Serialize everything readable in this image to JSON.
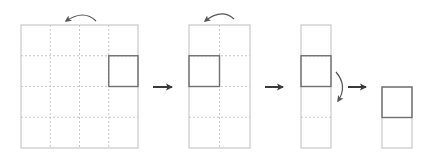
{
  "diagram": {
    "colors": {
      "background": "#ffffff",
      "grid_outline": "#c8c8c8",
      "grid_dashed": "#c8c8c8",
      "highlight": "#707070",
      "arrow": "#3a3a3a",
      "curved_arrow": "#555555"
    },
    "steps": [
      {
        "id": "step-1",
        "grid": {
          "x": 21,
          "y": 25,
          "cols": 4,
          "rows": 4,
          "cell_w": 29.25,
          "cell_h": 30.75
        },
        "highlight": {
          "col": 3,
          "row": 1
        },
        "fold_arrow": {
          "direction": "left",
          "position": "top"
        }
      },
      {
        "id": "step-2",
        "grid": {
          "x": 189,
          "y": 25,
          "cols": 2,
          "rows": 4,
          "cell_w": 30.5,
          "cell_h": 30.75
        },
        "highlight": {
          "col": 0,
          "row": 1
        },
        "fold_arrow": {
          "direction": "left",
          "position": "top"
        }
      },
      {
        "id": "step-3",
        "grid": {
          "x": 301,
          "y": 25,
          "cols": 1,
          "rows": 4,
          "cell_w": 30,
          "cell_h": 30.75
        },
        "highlight": {
          "col": 0,
          "row": 1
        },
        "fold_arrow": {
          "direction": "down",
          "position": "right"
        }
      },
      {
        "id": "step-4",
        "grid": {
          "x": 382,
          "y": 87,
          "cols": 1,
          "rows": 2,
          "cell_w": 30,
          "cell_h": 30.5
        },
        "highlight": {
          "col": 0,
          "row": 0
        },
        "fold_arrow": null
      }
    ],
    "transition_arrows": [
      {
        "from": "step-1",
        "to": "step-2",
        "x1": 153,
        "x2": 172,
        "y": 87
      },
      {
        "from": "step-2",
        "to": "step-3",
        "x1": 265,
        "x2": 283,
        "y": 87
      },
      {
        "from": "step-3",
        "to": "step-4",
        "x1": 348,
        "x2": 366,
        "y": 87
      }
    ]
  }
}
